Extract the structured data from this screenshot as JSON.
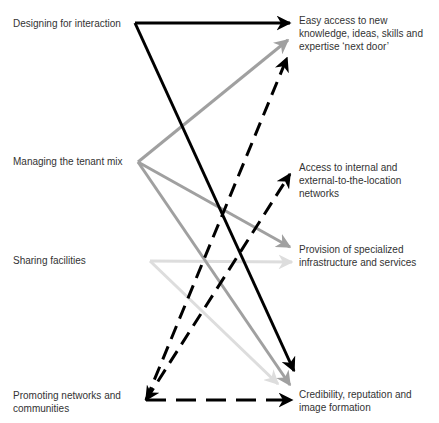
{
  "left_nodes": [
    {
      "id": "designing",
      "label": "Designing for interaction"
    },
    {
      "id": "managing",
      "label": "Managing the tenant mix"
    },
    {
      "id": "sharing",
      "label": "Sharing facilities"
    },
    {
      "id": "promoting",
      "label": "Promoting networks and\ncommunities"
    }
  ],
  "right_nodes": [
    {
      "id": "easy_access",
      "label": "Easy access to new\nknowledge, ideas, skills and\nexpertise ‘next door’"
    },
    {
      "id": "access_networks",
      "label": "Access to internal and\nexternal-to-the-location\nnetworks"
    },
    {
      "id": "provision",
      "label": "Provision of specialized\ninfrastructure and services"
    },
    {
      "id": "credibility",
      "label": "Credibility, reputation and\nimage formation"
    }
  ],
  "edges": [
    {
      "from": "designing",
      "to": "easy_access",
      "style": "solid",
      "color": "#000000"
    },
    {
      "from": "designing",
      "to": "credibility",
      "style": "solid",
      "color": "#000000"
    },
    {
      "from": "managing",
      "to": "easy_access",
      "style": "solid",
      "color": "#a0a0a0"
    },
    {
      "from": "managing",
      "to": "provision",
      "style": "solid",
      "color": "#a0a0a0"
    },
    {
      "from": "managing",
      "to": "credibility",
      "style": "solid",
      "color": "#a0a0a0"
    },
    {
      "from": "sharing",
      "to": "provision",
      "style": "solid",
      "color": "#dddddd"
    },
    {
      "from": "sharing",
      "to": "credibility",
      "style": "solid",
      "color": "#dddddd"
    },
    {
      "from": "promoting",
      "to": "easy_access",
      "style": "dashed",
      "color": "#000000"
    },
    {
      "from": "promoting",
      "to": "access_networks",
      "style": "dashed",
      "color": "#000000"
    },
    {
      "from": "promoting",
      "to": "credibility",
      "style": "dashed",
      "color": "#000000"
    }
  ],
  "colors": {
    "black": "#000000",
    "mid_gray": "#a0a0a0",
    "light_gray": "#dddddd",
    "text": "#333333"
  }
}
